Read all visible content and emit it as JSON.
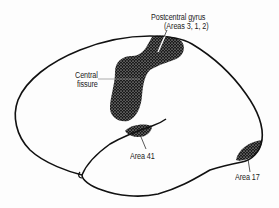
{
  "diagram": {
    "type": "brain-lateral-view",
    "labels": {
      "postcentral_line1": "Postcentral gyrus",
      "postcentral_line2": "(Areas 3, 1, 2)",
      "central_line1": "Central",
      "central_line2": "fissure",
      "area41": "Area 41",
      "area17": "Area 17"
    },
    "colors": {
      "outline": "#111111",
      "stipple_fill": "#1c1c1c",
      "background": "#fdfdfd"
    }
  }
}
